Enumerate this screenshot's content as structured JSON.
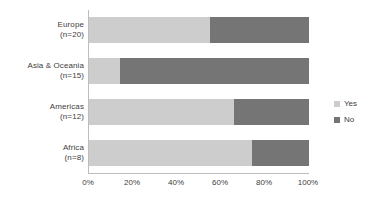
{
  "chart_data": {
    "type": "bar",
    "subtype": "stacked-horizontal-100pct",
    "title": "",
    "xlabel": "",
    "ylabel": "",
    "categories": [
      "Europe",
      "Asia & Oceania",
      "Americas",
      "Africa"
    ],
    "category_labels": [
      {
        "name": "Europe",
        "n": "(n=20)"
      },
      {
        "name": "Asia & Oceania",
        "n": "(n=15)"
      },
      {
        "name": "Americas",
        "n": "(n=12)"
      },
      {
        "name": "Africa",
        "n": "(n=8)"
      }
    ],
    "series": [
      {
        "name": "Yes",
        "color": "#cdcdcd",
        "values": [
          55,
          14,
          66,
          74
        ]
      },
      {
        "name": "No",
        "color": "#757575",
        "values": [
          45,
          86,
          34,
          26
        ]
      }
    ],
    "xlim": [
      0,
      100
    ],
    "xticks": [
      0,
      20,
      40,
      60,
      80,
      100
    ],
    "xtick_labels": [
      "0%",
      "20%",
      "40%",
      "60%",
      "80%",
      "100%"
    ],
    "grid": false,
    "legend_position": "right",
    "legend": [
      {
        "label": "Yes",
        "color": "#cdcdcd"
      },
      {
        "label": "No",
        "color": "#757575"
      }
    ],
    "background_color": "#ffffff",
    "axis_color": "#bdbdbd",
    "text_color": "#404040"
  }
}
